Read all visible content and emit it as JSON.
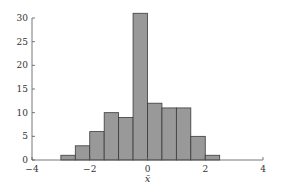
{
  "chart_data": {
    "type": "bar",
    "subtype": "histogram",
    "title": "",
    "xlabel": "x̄",
    "ylabel": "",
    "xlim": [
      -4,
      4
    ],
    "ylim": [
      0,
      31
    ],
    "xticks": [
      -4,
      -2,
      0,
      2,
      4
    ],
    "xtick_labels": [
      "−4",
      "−2",
      "0",
      "2",
      "4"
    ],
    "yticks": [
      0,
      5,
      10,
      15,
      20,
      25,
      30
    ],
    "ytick_labels": [
      "0",
      "5",
      "10",
      "15",
      "20",
      "25",
      "30"
    ],
    "grid": false,
    "legend": null,
    "bin_edges": [
      -3.0,
      -2.5,
      -2.0,
      -1.5,
      -1.0,
      -0.5,
      0.0,
      0.5,
      1.0,
      1.5,
      2.0,
      2.5
    ],
    "categories": [
      "-3.0 to -2.5",
      "-2.5 to -2.0",
      "-2.0 to -1.5",
      "-1.5 to -1.0",
      "-1.0 to -0.5",
      "-0.5 to 0.0",
      "0.0 to 0.5",
      "0.5 to 1.0",
      "1.0 to 1.5",
      "1.5 to 2.0",
      "2.0 to 2.5"
    ],
    "values": [
      1,
      3,
      6,
      10,
      9,
      31,
      12,
      11,
      11,
      5,
      1
    ],
    "colors": {
      "bar_fill": "#999999",
      "bar_edge": "#3a3a3a",
      "axis": "#555555"
    }
  }
}
